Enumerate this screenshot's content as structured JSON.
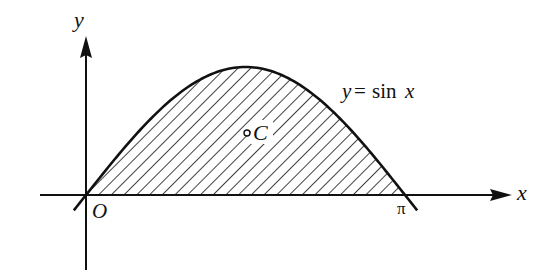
{
  "diagram": {
    "axes": {
      "x_label": "x",
      "y_label": "y",
      "origin_label": "O",
      "pi_label": "π"
    },
    "curve": {
      "equation_lhs": "y",
      "equation_eq": "=",
      "equation_fn": "sin",
      "equation_var": "x"
    },
    "centroid": {
      "label": "C"
    },
    "colors": {
      "ink": "#111111",
      "background": "#ffffff"
    }
  }
}
